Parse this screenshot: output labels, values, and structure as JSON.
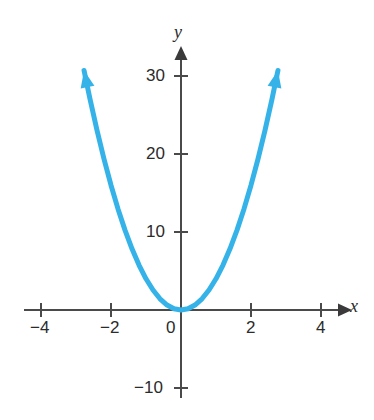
{
  "figure": {
    "background_color": "#ffffff",
    "curve_color": "#35b3e8",
    "axis_color": "#4a4a4a",
    "text_color": "#2b2b2b"
  },
  "axes": {
    "x_axis_name": "x",
    "y_axis_name": "y",
    "x_ticks": [
      {
        "label": "−4",
        "value": -4
      },
      {
        "label": "−2",
        "value": -2
      },
      {
        "label": "0",
        "value": 0
      },
      {
        "label": "2",
        "value": 2
      },
      {
        "label": "4",
        "value": 4
      }
    ],
    "y_ticks": [
      {
        "label": "30",
        "value": 30
      },
      {
        "label": "20",
        "value": 20
      },
      {
        "label": "10",
        "value": 10
      },
      {
        "label": "−10",
        "value": -10
      }
    ]
  },
  "chart_data": {
    "type": "line",
    "title": "",
    "subtitle": "",
    "xlabel": "x",
    "ylabel": "y",
    "xlim": [
      -4.5,
      4.5
    ],
    "ylim": [
      -13,
      34
    ],
    "grid": false,
    "legend": null,
    "annotations": [],
    "series": [
      {
        "name": "y = 4x²",
        "color": "#35b3e8",
        "line_width": 5,
        "arrow_start": true,
        "arrow_end": true,
        "x": [
          -2.77,
          -2.6,
          -2.4,
          -2.2,
          -2.0,
          -1.8,
          -1.6,
          -1.4,
          -1.2,
          -1.0,
          -0.8,
          -0.6,
          -0.4,
          -0.2,
          0.0,
          0.2,
          0.4,
          0.6,
          0.8,
          1.0,
          1.2,
          1.4,
          1.6,
          1.8,
          2.0,
          2.2,
          2.4,
          2.6,
          2.77
        ],
        "values": [
          30.7,
          27.04,
          23.04,
          19.36,
          16.0,
          12.96,
          10.24,
          7.84,
          5.76,
          4.0,
          2.56,
          1.44,
          0.64,
          0.16,
          0.0,
          0.16,
          0.64,
          1.44,
          2.56,
          4.0,
          5.76,
          7.84,
          10.24,
          12.96,
          16.0,
          19.36,
          23.04,
          27.04,
          30.7
        ]
      }
    ]
  }
}
